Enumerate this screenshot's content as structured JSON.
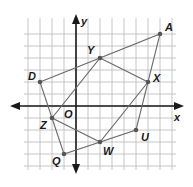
{
  "diagram": {
    "type": "coordinate-grid",
    "grid": {
      "x_min": -4,
      "x_max": 8,
      "y_min": -5,
      "y_max": 7,
      "unit_px": 12,
      "origin_px": [
        76,
        106
      ],
      "line_color": "#b8b8b8"
    },
    "axes": {
      "x_label": "x",
      "y_label": "y",
      "origin_label": "O",
      "color": "#1a1a1a"
    },
    "points": [
      {
        "label": "A",
        "x": 7,
        "y": 6
      },
      {
        "label": "Y",
        "x": 2,
        "y": 4
      },
      {
        "label": "D",
        "x": -3,
        "y": 2
      },
      {
        "label": "X",
        "x": 6,
        "y": 2
      },
      {
        "label": "Z",
        "x": -2,
        "y": -1
      },
      {
        "label": "U",
        "x": 5,
        "y": -2
      },
      {
        "label": "W",
        "x": 2,
        "y": -3
      },
      {
        "label": "Q",
        "x": -1,
        "y": -4
      }
    ],
    "polygons": [
      {
        "name": "quadrilateral-DAUQ",
        "vertices": [
          "D",
          "A",
          "U",
          "Q"
        ]
      },
      {
        "name": "quadrilateral-YXWZ",
        "vertices": [
          "Y",
          "X",
          "W",
          "Z"
        ]
      }
    ],
    "edge_color": "#6a6a6a"
  }
}
